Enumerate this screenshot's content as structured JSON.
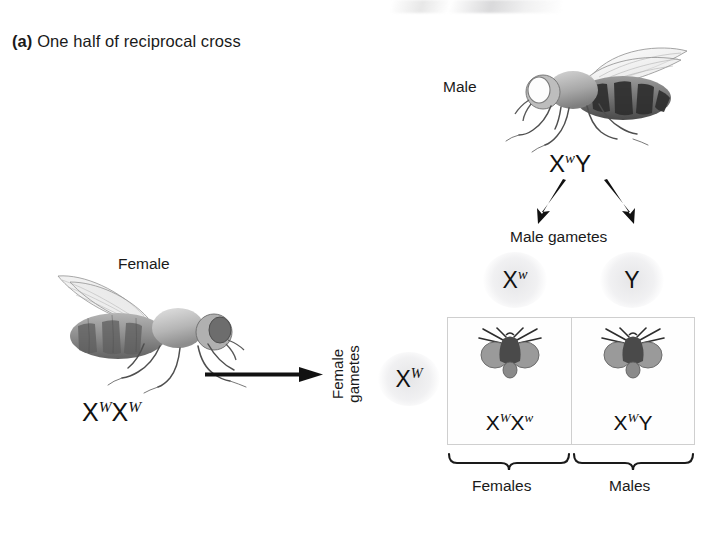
{
  "figure": {
    "panel_tag": "(a)",
    "panel_title": "One half of reciprocal cross"
  },
  "male_parent": {
    "label": "Male",
    "genotype_x": "X",
    "genotype_allele": "w",
    "genotype_tail": "Y"
  },
  "female_parent": {
    "label": "Female",
    "genotype_x1": "X",
    "genotype_allele1": "W",
    "genotype_x2": "X",
    "genotype_allele2": "W"
  },
  "male_gametes": {
    "caption": "Male gametes",
    "items": [
      {
        "base": "X",
        "allele": "w"
      },
      {
        "base": "Y",
        "allele": ""
      }
    ]
  },
  "female_gametes": {
    "caption_line1": "Female",
    "caption_line2": "gametes",
    "item": {
      "base": "X",
      "allele": "W"
    }
  },
  "punnett": {
    "cells": [
      {
        "name": "female-offspring",
        "base1": "X",
        "allele1": "W",
        "base2": "X",
        "allele2": "w",
        "group_label": "Females"
      },
      {
        "name": "male-offspring",
        "base1": "X",
        "allele1": "W",
        "base2": "Y",
        "allele2": "",
        "group_label": "Males"
      }
    ]
  },
  "colors": {
    "ink": "#1a1a1a",
    "grid_line": "#cfcfcf",
    "eye_gray": "#8d8d8d",
    "gamete_haze": "#e6e6e8"
  }
}
